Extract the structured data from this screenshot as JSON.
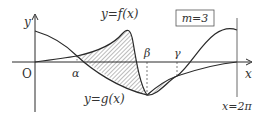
{
  "diagram": {
    "type": "function-graph-shaded-area",
    "labels": {
      "y_axis": "y",
      "x_axis": "x",
      "origin": "O",
      "f_curve": "y=f(x)",
      "g_curve": "y=g(x)",
      "alpha": "α",
      "beta": "β",
      "gamma": "γ",
      "right_bound": "x=2π",
      "parameter_box": "m=3"
    },
    "colors": {
      "line": "#2a2a2a",
      "hatch": "#555555",
      "text": "#333333",
      "background": "#ffffff"
    }
  }
}
